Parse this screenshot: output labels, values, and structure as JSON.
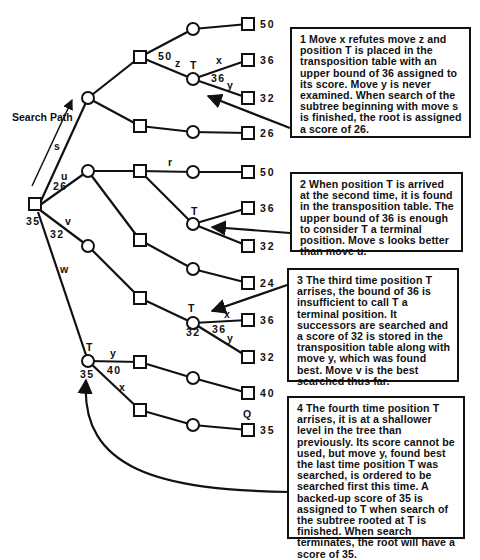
{
  "labels": {
    "search_path": "Search Path",
    "root_score": "35",
    "move_s": "s",
    "move_u": "u",
    "u_score": "26",
    "move_v": "v",
    "v_score": "32",
    "move_w": "w",
    "move_z": "z",
    "z_score": "50",
    "move_r": "r",
    "t_label": "T",
    "t1_x": "x",
    "t1_y": "y",
    "t1_bound": "36",
    "t3_x": "x",
    "t3_y": "y",
    "t3_bound": "36",
    "t3_score": "32",
    "t4_y": "y",
    "t4_y_score": "40",
    "t4_x": "x",
    "t4_score": "35",
    "q_label": "Q"
  },
  "leaf_scores": [
    "50",
    "36",
    "32",
    "26",
    "50",
    "36",
    "32",
    "24",
    "36",
    "32",
    "40",
    "35"
  ],
  "notes": [
    {
      "id": 1,
      "text": "1  Move x refutes move z and position T is placed in the transposition table with an upper bound of 36 assigned to its score.  Move y is never examined.  When search of the subtree beginning with move s is finished, the root is assigned a score of 26."
    },
    {
      "id": 2,
      "text": "2  When position T is arrived at the second time, it is found in the transposition table.  The upper bound of 36 is enough to consider T a terminal position.  Move s looks better than move u."
    },
    {
      "id": 3,
      "text": "3  The third time position T arrises, the bound of 36 is insufficient to call T a terminal position.  It successors are searched and a score of 32 is stored in the transposition table along with move y, which was found best.  Move v is the best searched thus far."
    },
    {
      "id": 4,
      "text": "4  The fourth time position T arrises, it is at a shallower level in the tree than previously.  Its score cannot be used, but move y, found best the last time position T was searched, is ordered to be searched first this time.  A backed-up score of 35 is assigned to T when search of the subtree rooted at T is finished.  When search terminates, the root will have a score of 35."
    }
  ]
}
